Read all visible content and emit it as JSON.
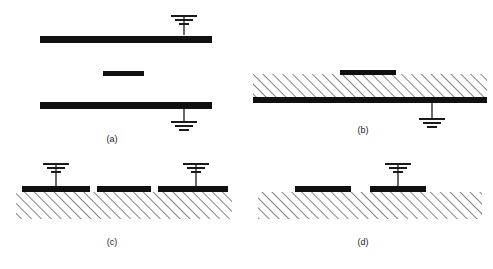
{
  "figure": {
    "title": "",
    "background_color": "#ffffff",
    "conductor_color": "#101010",
    "ground_symbol_color": "#1a1a1a",
    "hatch_color": "#2b2b2b",
    "width": 493,
    "height": 269
  },
  "panels": [
    {
      "id": "a",
      "label": "(a)",
      "name": "stripline",
      "label_x": 112,
      "label_y": 142,
      "conductors": [
        {
          "name": "top-ground-plane",
          "x": 40,
          "y": 36,
          "width": 172,
          "height": 7
        },
        {
          "name": "center-strip",
          "x": 103,
          "y": 71,
          "width": 41,
          "height": 5
        },
        {
          "name": "bottom-ground-plane",
          "x": 40,
          "y": 102,
          "width": 172,
          "height": 7
        }
      ],
      "ground_symbols": [
        {
          "name": "ground-top",
          "x": 184,
          "y": 16,
          "stem_length": 19,
          "orientation": "up"
        },
        {
          "name": "ground-bottom",
          "x": 184,
          "y": 109,
          "stem_length": 13,
          "orientation": "down"
        }
      ],
      "hatched_regions": []
    },
    {
      "id": "b",
      "label": "(b)",
      "name": "microstrip-inverted",
      "label_x": 363,
      "label_y": 133,
      "conductors": [
        {
          "name": "signal-strip",
          "x": 340,
          "y": 70,
          "width": 56,
          "height": 5
        },
        {
          "name": "ground-plane",
          "x": 253,
          "y": 97,
          "width": 234,
          "height": 6
        }
      ],
      "ground_symbols": [
        {
          "name": "ground-right",
          "x": 432,
          "y": 103,
          "stem_length": 16,
          "orientation": "down"
        }
      ],
      "hatched_regions": [
        {
          "name": "dielectric-substrate",
          "x": 253,
          "y": 74,
          "width": 234,
          "height": 24
        }
      ]
    },
    {
      "id": "c",
      "label": "(c)",
      "name": "coplanar-waveguide",
      "label_x": 112,
      "label_y": 245,
      "conductors": [
        {
          "name": "left-ground-strip",
          "x": 22,
          "y": 186,
          "width": 68,
          "height": 6
        },
        {
          "name": "center-signal-strip",
          "x": 97,
          "y": 186,
          "width": 54,
          "height": 6
        },
        {
          "name": "right-ground-strip",
          "x": 158,
          "y": 186,
          "width": 70,
          "height": 6
        }
      ],
      "ground_symbols": [
        {
          "name": "ground-left",
          "x": 56,
          "y": 164,
          "stem_length": 22,
          "orientation": "up"
        },
        {
          "name": "ground-right",
          "x": 196,
          "y": 164,
          "stem_length": 22,
          "orientation": "up"
        }
      ],
      "hatched_regions": [
        {
          "name": "dielectric-substrate",
          "x": 16,
          "y": 192,
          "width": 216,
          "height": 27
        }
      ]
    },
    {
      "id": "d",
      "label": "(d)",
      "name": "coplanar-strips",
      "label_x": 363,
      "label_y": 245,
      "conductors": [
        {
          "name": "left-signal-strip",
          "x": 295,
          "y": 186,
          "width": 56,
          "height": 6
        },
        {
          "name": "right-ground-strip",
          "x": 370,
          "y": 186,
          "width": 56,
          "height": 6
        }
      ],
      "ground_symbols": [
        {
          "name": "ground-right",
          "x": 398,
          "y": 164,
          "stem_length": 22,
          "orientation": "up"
        }
      ],
      "hatched_regions": [
        {
          "name": "dielectric-substrate",
          "x": 258,
          "y": 192,
          "width": 224,
          "height": 27
        }
      ]
    }
  ],
  "ground_symbol_geometry": {
    "bar_widths": [
      26,
      18,
      10
    ],
    "bar_gap": 4,
    "bar_thickness": 2
  }
}
